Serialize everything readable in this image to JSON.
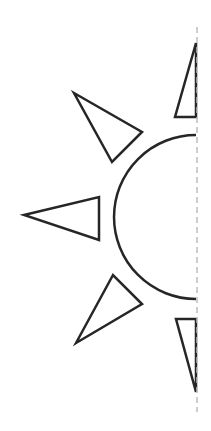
{
  "illustration": {
    "subject": "half sun outline with symmetry line",
    "stroke_color": "#262626",
    "guide_color": "#bdbdbd",
    "semicircle": {
      "cx": 196,
      "cy": 217,
      "r": 82
    },
    "rays": [
      {
        "name": "top",
        "points": "196,43 175,117 196,117"
      },
      {
        "name": "upper-left",
        "points": "74,93 142,132 112,162"
      },
      {
        "name": "left",
        "points": "24,215 99,197 99,240"
      },
      {
        "name": "lower-left",
        "points": "76,343 142,304 113,275"
      },
      {
        "name": "bottom",
        "points": "196,392 176,319 196,319"
      }
    ],
    "symmetry_line": {
      "x": 197,
      "y1": 27,
      "y2": 412
    }
  }
}
